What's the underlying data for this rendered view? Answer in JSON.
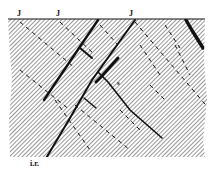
{
  "figure": {
    "labels": {
      "joint_1": "J",
      "joint_2": "J",
      "joint_3": "J",
      "s_label": "s",
      "ir_label": "i.r."
    },
    "colors": {
      "ink": "#111111",
      "hatch": "#444444",
      "background": "#ffffff"
    }
  }
}
